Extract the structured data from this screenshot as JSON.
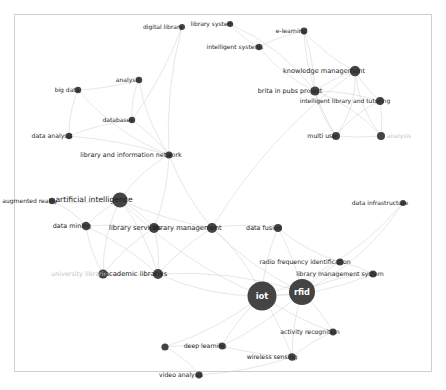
{
  "meta": {
    "view_title": "bibliometric co-occurrence network map",
    "background_color": "#ffffff",
    "node_color": "#444444",
    "edge_color": "#c9c9c9",
    "label_color": "#1c1c1c",
    "faded_label_color": "#c6c6c6",
    "border_color": "#cfcfcf"
  },
  "chart_data": {
    "type": "scatter",
    "title": "",
    "subtitle": "",
    "xlabel": "",
    "ylabel": "",
    "grid": false,
    "legend": "none",
    "xlim": [
      0,
      446
    ],
    "ylim": [
      0,
      390
    ],
    "nodes": [
      {
        "id": "digital-library",
        "label": "digital library",
        "x": 182,
        "y": 27,
        "r": 3.0,
        "label_dx": -19,
        "label_dy": 0,
        "style": "normal",
        "font_size": 6.0
      },
      {
        "id": "library-system",
        "label": "library system",
        "x": 230,
        "y": 24,
        "r": 3.0,
        "label_dx": -18,
        "label_dy": 0,
        "style": "normal",
        "font_size": 6.0
      },
      {
        "id": "intelligent-systems",
        "label": "intelligent systems",
        "x": 259,
        "y": 47,
        "r": 3.2,
        "label_dx": -24,
        "label_dy": 0,
        "style": "normal",
        "font_size": 6.0
      },
      {
        "id": "e-learning",
        "label": "e-learning",
        "x": 304,
        "y": 31,
        "r": 3.4,
        "label_dx": -13,
        "label_dy": 0,
        "style": "normal",
        "font_size": 6.0
      },
      {
        "id": "knowledge-management",
        "label": "knowledge management",
        "x": 355,
        "y": 71,
        "r": 5.2,
        "label_dx": -31,
        "label_dy": 0,
        "style": "normal",
        "font_size": 6.6
      },
      {
        "id": "brita-in-pubs-project",
        "label": "brita in pubs project",
        "x": 315,
        "y": 91,
        "r": 4.6,
        "label_dx": -25,
        "label_dy": 0,
        "style": "normal",
        "font_size": 6.4
      },
      {
        "id": "intelligent-library-and-tutoring",
        "label": "intelligent library and tutoring",
        "x": 380,
        "y": 101,
        "r": 4.0,
        "label_dx": -35,
        "label_dy": 0,
        "style": "normal",
        "font_size": 6.0
      },
      {
        "id": "multi-user",
        "label": "multi user",
        "x": 336,
        "y": 136,
        "r": 4.0,
        "label_dx": -13,
        "label_dy": 0,
        "style": "normal",
        "font_size": 6.2
      },
      {
        "id": "analysis-faded",
        "label": "analysis",
        "x": 381,
        "y": 136,
        "r": 4.0,
        "label_dx": 18,
        "label_dy": 0,
        "style": "faded",
        "font_size": 6.0
      },
      {
        "id": "analysis",
        "label": "analysis",
        "x": 139,
        "y": 80,
        "r": 3.2,
        "label_dx": -11,
        "label_dy": 0,
        "style": "normal",
        "font_size": 6.0
      },
      {
        "id": "big-data",
        "label": "big data",
        "x": 78,
        "y": 90,
        "r": 3.2,
        "label_dx": -11,
        "label_dy": 0,
        "style": "normal",
        "font_size": 6.0
      },
      {
        "id": "databases",
        "label": "databases",
        "x": 132,
        "y": 120,
        "r": 3.2,
        "label_dx": -14,
        "label_dy": 0,
        "style": "normal",
        "font_size": 6.0
      },
      {
        "id": "data-analysis",
        "label": "data analysis",
        "x": 69,
        "y": 136,
        "r": 3.2,
        "label_dx": -17,
        "label_dy": 0,
        "style": "normal",
        "font_size": 6.2
      },
      {
        "id": "library-and-information-network",
        "label": "library and information network",
        "x": 169,
        "y": 155,
        "r": 3.6,
        "label_dx": -38,
        "label_dy": 0,
        "style": "normal",
        "font_size": 6.4
      },
      {
        "id": "augmented-reality",
        "label": "augmented reality",
        "x": 52,
        "y": 201,
        "r": 3.2,
        "label_dx": -22,
        "label_dy": 0,
        "style": "normal",
        "font_size": 6.0
      },
      {
        "id": "artificial-intelligence",
        "label": "artificial intelligence",
        "x": 120,
        "y": 200,
        "r": 7.6,
        "label_dx": -26,
        "label_dy": 0,
        "style": "normal",
        "font_size": 7.6
      },
      {
        "id": "data-mining",
        "label": "data mining",
        "x": 86,
        "y": 226,
        "r": 4.2,
        "label_dx": -14,
        "label_dy": 0,
        "style": "normal",
        "font_size": 6.4
      },
      {
        "id": "library-services",
        "label": "library services",
        "x": 154,
        "y": 228,
        "r": 5.0,
        "label_dx": -19,
        "label_dy": 0,
        "style": "normal",
        "font_size": 6.8
      },
      {
        "id": "library-management",
        "label": "library management",
        "x": 212,
        "y": 228,
        "r": 5.0,
        "label_dx": -25,
        "label_dy": 0,
        "style": "normal",
        "font_size": 6.8
      },
      {
        "id": "university-libraries",
        "label": "university libraries",
        "x": 103,
        "y": 274,
        "r": 4.6,
        "label_dx": -22,
        "label_dy": 0,
        "style": "faded",
        "font_size": 6.4
      },
      {
        "id": "academic-libraries",
        "label": "academic libraries",
        "x": 158,
        "y": 274,
        "r": 5.0,
        "label_dx": -22,
        "label_dy": 0,
        "style": "normal",
        "font_size": 6.8
      },
      {
        "id": "data-fusion",
        "label": "data fusion",
        "x": 278,
        "y": 228,
        "r": 4.0,
        "label_dx": -14,
        "label_dy": 0,
        "style": "normal",
        "font_size": 6.4
      },
      {
        "id": "data-infrastructure",
        "label": "data infrastructure",
        "x": 403,
        "y": 203,
        "r": 3.0,
        "label_dx": -23,
        "label_dy": 0,
        "style": "normal",
        "font_size": 6.0
      },
      {
        "id": "radio-frequency-identification",
        "label": "radio frequency identification",
        "x": 340,
        "y": 262,
        "r": 3.6,
        "label_dx": -35,
        "label_dy": 0,
        "style": "normal",
        "font_size": 6.2
      },
      {
        "id": "library-management-system",
        "label": "library management system",
        "x": 373,
        "y": 274,
        "r": 3.6,
        "label_dx": -33,
        "label_dy": 0,
        "style": "normal",
        "font_size": 6.2
      },
      {
        "id": "iot",
        "label": "iot",
        "x": 262,
        "y": 296,
        "r": 14.5,
        "label_dx": 0,
        "label_dy": 0,
        "style": "inverse",
        "font_size": 8.4
      },
      {
        "id": "rfid",
        "label": "rfid",
        "x": 302,
        "y": 292,
        "r": 13.0,
        "label_dx": 0,
        "label_dy": 0,
        "style": "inverse",
        "font_size": 8.2
      },
      {
        "id": "activity-recognition",
        "label": "activity recognition",
        "x": 333,
        "y": 332,
        "r": 3.4,
        "label_dx": -23,
        "label_dy": 0,
        "style": "normal",
        "font_size": 6.2
      },
      {
        "id": "wireless-sensing",
        "label": "wireless sensing",
        "x": 292,
        "y": 357,
        "r": 3.8,
        "label_dx": -20,
        "label_dy": 0,
        "style": "normal",
        "font_size": 6.2
      },
      {
        "id": "deep-learning",
        "label": "deep learning",
        "x": 222,
        "y": 346,
        "r": 3.4,
        "label_dx": -17,
        "label_dy": 0,
        "style": "normal",
        "font_size": 6.2
      },
      {
        "id": "video-analysis",
        "label": "video analysis",
        "x": 199,
        "y": 375,
        "r": 3.4,
        "label_dx": -18,
        "label_dy": 0,
        "style": "normal",
        "font_size": 6.2
      },
      {
        "id": "unlabeled-node-left",
        "label": "",
        "x": 165,
        "y": 347,
        "r": 3.6,
        "label_dx": 0,
        "label_dy": 0,
        "style": "hidden",
        "font_size": 6.0
      }
    ],
    "edges": [
      {
        "source": "digital-library",
        "target": "library-and-information-network",
        "curve": 30
      },
      {
        "source": "digital-library",
        "target": "databases",
        "curve": -20
      },
      {
        "source": "library-system",
        "target": "intelligent-systems",
        "curve": 12
      },
      {
        "source": "library-system",
        "target": "brita-in-pubs-project",
        "curve": -40
      },
      {
        "source": "intelligent-systems",
        "target": "brita-in-pubs-project",
        "curve": 25
      },
      {
        "source": "intelligent-systems",
        "target": "e-learning",
        "curve": -10
      },
      {
        "source": "e-learning",
        "target": "knowledge-management",
        "curve": 18
      },
      {
        "source": "e-learning",
        "target": "brita-in-pubs-project",
        "curve": -12
      },
      {
        "source": "e-learning",
        "target": "multi-user",
        "curve": 40
      },
      {
        "source": "knowledge-management",
        "target": "brita-in-pubs-project",
        "curve": 10
      },
      {
        "source": "knowledge-management",
        "target": "intelligent-library-and-tutoring",
        "curve": 8
      },
      {
        "source": "knowledge-management",
        "target": "multi-user",
        "curve": -35
      },
      {
        "source": "knowledge-management",
        "target": "analysis-faded",
        "curve": 30
      },
      {
        "source": "brita-in-pubs-project",
        "target": "intelligent-library-and-tutoring",
        "curve": -14
      },
      {
        "source": "brita-in-pubs-project",
        "target": "multi-user",
        "curve": 16
      },
      {
        "source": "brita-in-pubs-project",
        "target": "analysis-faded",
        "curve": -30
      },
      {
        "source": "intelligent-library-and-tutoring",
        "target": "multi-user",
        "curve": 20
      },
      {
        "source": "intelligent-library-and-tutoring",
        "target": "analysis-faded",
        "curve": -8
      },
      {
        "source": "multi-user",
        "target": "analysis-faded",
        "curve": 6
      },
      {
        "source": "knowledge-management",
        "target": "library-management",
        "curve": 60
      },
      {
        "source": "analysis",
        "target": "databases",
        "curve": 14
      },
      {
        "source": "analysis",
        "target": "library-and-information-network",
        "curve": 26
      },
      {
        "source": "analysis",
        "target": "big-data",
        "curve": -10
      },
      {
        "source": "big-data",
        "target": "data-analysis",
        "curve": 14
      },
      {
        "source": "big-data",
        "target": "library-and-information-network",
        "curve": 40
      },
      {
        "source": "databases",
        "target": "library-and-information-network",
        "curve": -10
      },
      {
        "source": "databases",
        "target": "data-analysis",
        "curve": 12
      },
      {
        "source": "data-analysis",
        "target": "library-and-information-network",
        "curve": -16
      },
      {
        "source": "library-and-information-network",
        "target": "artificial-intelligence",
        "curve": 24
      },
      {
        "source": "library-and-information-network",
        "target": "library-services",
        "curve": -18
      },
      {
        "source": "library-and-information-network",
        "target": "library-management",
        "curve": 20
      },
      {
        "source": "augmented-reality",
        "target": "artificial-intelligence",
        "curve": 12
      },
      {
        "source": "augmented-reality",
        "target": "data-mining",
        "curve": -14
      },
      {
        "source": "artificial-intelligence",
        "target": "data-mining",
        "curve": 10
      },
      {
        "source": "artificial-intelligence",
        "target": "library-services",
        "curve": -12
      },
      {
        "source": "artificial-intelligence",
        "target": "library-management",
        "curve": 18
      },
      {
        "source": "artificial-intelligence",
        "target": "academic-libraries",
        "curve": -22
      },
      {
        "source": "artificial-intelligence",
        "target": "university-libraries",
        "curve": 26
      },
      {
        "source": "artificial-intelligence",
        "target": "iot",
        "curve": 50
      },
      {
        "source": "data-mining",
        "target": "library-services",
        "curve": -10
      },
      {
        "source": "data-mining",
        "target": "university-libraries",
        "curve": 14
      },
      {
        "source": "data-mining",
        "target": "academic-libraries",
        "curve": -18
      },
      {
        "source": "library-services",
        "target": "library-management",
        "curve": 8
      },
      {
        "source": "library-services",
        "target": "academic-libraries",
        "curve": -12
      },
      {
        "source": "library-services",
        "target": "university-libraries",
        "curve": 16
      },
      {
        "source": "library-management",
        "target": "academic-libraries",
        "curve": 14
      },
      {
        "source": "library-management",
        "target": "data-fusion",
        "curve": -16
      },
      {
        "source": "library-management",
        "target": "rfid",
        "curve": 28
      },
      {
        "source": "library-management",
        "target": "iot",
        "curve": -30
      },
      {
        "source": "university-libraries",
        "target": "academic-libraries",
        "curve": 6
      },
      {
        "source": "academic-libraries",
        "target": "iot",
        "curve": 34
      },
      {
        "source": "academic-libraries",
        "target": "rfid",
        "curve": -40
      },
      {
        "source": "data-fusion",
        "target": "iot",
        "curve": 18
      },
      {
        "source": "data-fusion",
        "target": "rfid",
        "curve": -14
      },
      {
        "source": "data-fusion",
        "target": "radio-frequency-identification",
        "curve": 20
      },
      {
        "source": "radio-frequency-identification",
        "target": "rfid",
        "curve": 10
      },
      {
        "source": "radio-frequency-identification",
        "target": "library-management-system",
        "curve": -8
      },
      {
        "source": "library-management-system",
        "target": "rfid",
        "curve": 22
      },
      {
        "source": "library-management-system",
        "target": "iot",
        "curve": -34
      },
      {
        "source": "iot",
        "target": "rfid",
        "curve": 4
      },
      {
        "source": "iot",
        "target": "activity-recognition",
        "curve": 14
      },
      {
        "source": "iot",
        "target": "wireless-sensing",
        "curve": -12
      },
      {
        "source": "iot",
        "target": "deep-learning",
        "curve": 16
      },
      {
        "source": "iot",
        "target": "unlabeled-node-left",
        "curve": -26
      },
      {
        "source": "rfid",
        "target": "activity-recognition",
        "curve": -10
      },
      {
        "source": "rfid",
        "target": "wireless-sensing",
        "curve": 14
      },
      {
        "source": "rfid",
        "target": "deep-learning",
        "curve": -20
      },
      {
        "source": "activity-recognition",
        "target": "wireless-sensing",
        "curve": 10
      },
      {
        "source": "wireless-sensing",
        "target": "deep-learning",
        "curve": -10
      },
      {
        "source": "deep-learning",
        "target": "unlabeled-node-left",
        "curve": 8
      },
      {
        "source": "unlabeled-node-left",
        "target": "video-analysis",
        "curve": -14
      },
      {
        "source": "video-analysis",
        "target": "wireless-sensing",
        "curve": 18
      },
      {
        "source": "iot",
        "target": "data-infrastructure",
        "curve": 70
      },
      {
        "source": "rfid",
        "target": "data-infrastructure",
        "curve": 55
      }
    ]
  }
}
